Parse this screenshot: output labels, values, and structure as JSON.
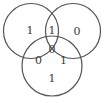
{
  "diagram": {
    "type": "three-set venn diagram",
    "background": "#ffffff",
    "stroke_color": "#555555",
    "text_color": "#3a3a3a",
    "regions": {
      "left_only": "1",
      "top_intersection": "1",
      "right_only": "0",
      "center_all": "0",
      "left_bottom_intersection": "0",
      "right_bottom_intersection": "1",
      "bottom_only": "1"
    }
  }
}
